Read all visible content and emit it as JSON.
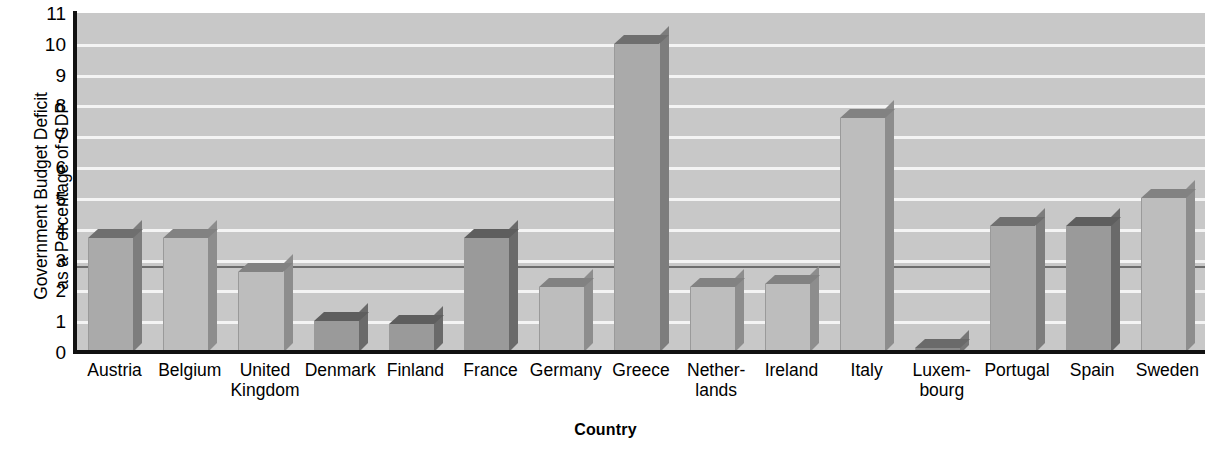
{
  "chart_data": {
    "type": "bar",
    "title": "",
    "xlabel": "Country",
    "ylabel": "Government Budget Deficit\nas a Percentage of GDP",
    "ylim": [
      0,
      11
    ],
    "ytick_labels": [
      "0",
      "1",
      "2",
      "3",
      "4",
      "5",
      "6",
      "7",
      "8",
      "9",
      "10",
      "11"
    ],
    "ytick_values": [
      0,
      1,
      2,
      3,
      4,
      5,
      6,
      7,
      8,
      9,
      10,
      11
    ],
    "grid": true,
    "grid_orientation": "horizontal",
    "legend": false,
    "categories": [
      "Austria",
      "Belgium",
      "United\nKingdom",
      "Denmark",
      "Finland",
      "France",
      "Germany",
      "Greece",
      "Nether-\nlands",
      "Ireland",
      "Italy",
      "Luxem-\nbourg",
      "Portugal",
      "Spain",
      "Sweden"
    ],
    "values": [
      3.7,
      3.7,
      2.6,
      1.0,
      0.9,
      3.7,
      2.1,
      10.0,
      2.1,
      2.2,
      7.6,
      -0.2,
      4.1,
      4.1,
      5.0
    ],
    "annotations": [
      {
        "type": "reference-line",
        "orientation": "horizontal",
        "value": 2.8,
        "label": ""
      }
    ]
  },
  "colors": {
    "plot_background": "#c8c8c8",
    "gridline": "#f4f4f4",
    "axis": "#111111",
    "bar_face": "#aaaaaa",
    "bar_top": "#6f6f6f",
    "bar_side": "#7d7d7d",
    "reference_line": "#6d6d6d",
    "page_background": "#ffffff",
    "text": "#000000"
  }
}
